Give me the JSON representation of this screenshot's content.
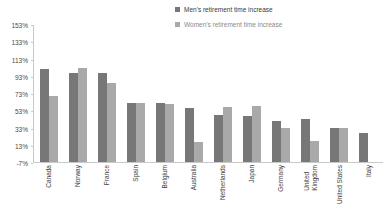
{
  "chart_data": {
    "type": "bar",
    "title": "",
    "xlabel": "",
    "ylabel": "",
    "grid": false,
    "legend_position": "top-right",
    "ylim": [
      -7,
      153
    ],
    "ytick_step": 20,
    "yticks": [
      "153%",
      "133%",
      "113%",
      "93%",
      "73%",
      "53%",
      "33%",
      "13%",
      "-7%"
    ],
    "ytick_values": [
      153,
      133,
      113,
      93,
      73,
      53,
      33,
      13,
      -7
    ],
    "categories": [
      "Canada",
      "Norway",
      "France",
      "Spain",
      "Belgium",
      "Australia",
      "Netherlands",
      "Japan",
      "Germany",
      "United\nKingdom",
      "United States",
      "Italy"
    ],
    "series": [
      {
        "name": "Men's retirement time increase",
        "color": "#777777",
        "values": [
          101,
          96,
          96,
          62,
          61,
          56,
          48,
          46,
          41,
          43,
          33,
          27
        ]
      },
      {
        "name": "Women's retirement time increase",
        "color": "#a9a9a9",
        "values": [
          69,
          102,
          85,
          62,
          60,
          16,
          57,
          58,
          33,
          17,
          33,
          0
        ]
      }
    ]
  },
  "legend": {
    "items": [
      {
        "label": "Men's retirement time increase",
        "color": "#777777"
      },
      {
        "label": "Women's retirement time increase",
        "color": "#a9a9a9"
      }
    ]
  }
}
